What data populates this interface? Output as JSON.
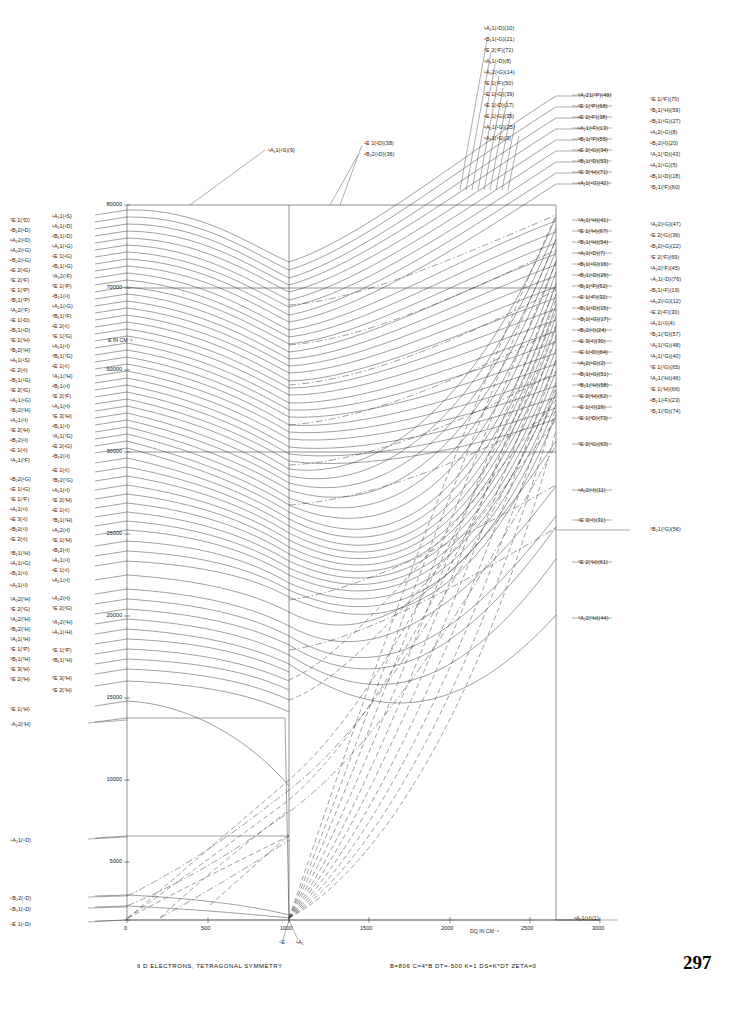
{
  "figure": {
    "caption": "6 D ELECTRONS, TETRAGONAL SYMMETRY",
    "parameters": "B=806  C=4*B  DT=-500  K=1  DS=K*DT  ZETA=0",
    "page_number": "297"
  },
  "axes": {
    "y_title": "E IN CM⁻¹",
    "x_title": "DQ IN CM⁻¹",
    "y_ticks": [
      "80000",
      "70000",
      "50000",
      "30000",
      "25000",
      "20000",
      "15000",
      "10000",
      "5000",
      "0"
    ],
    "x_ticks": [
      "0",
      "500",
      "1000",
      "1500",
      "2000",
      "2500",
      "3000"
    ],
    "x_range": [
      0,
      3000
    ],
    "y_range": [
      0,
      85000
    ],
    "ground_left": "⁵E",
    "ground_mid_left": "⁵E",
    "ground_mid_right": "¹A₁",
    "ground_right": "¹A₁1(¹I)(1)"
  },
  "chart_data": {
    "type": "line",
    "title": "6 D ELECTRONS, TETRAGONAL SYMMETRY",
    "xlabel": "DQ IN CM⁻¹",
    "ylabel": "E IN CM⁻¹",
    "xlim": [
      0,
      3000
    ],
    "ylim": [
      0,
      85000
    ],
    "grid": false,
    "legend": "none",
    "note": "Tanabe-Sugano style correlation diagram: energy levels of a d6 ion in tetragonal symmetry as a function of Dq. Level labels give term symbol, parent free-ion term in parentheses and state index."
  },
  "labels_left": [
    {
      "t": "³E  1(³D)",
      "y": 218
    },
    {
      "t": "¹B₂2(¹D)",
      "y": 228
    },
    {
      "t": "¹A₂2(¹D)",
      "y": 238
    },
    {
      "t": "¹A₂2(¹G)",
      "y": 248
    },
    {
      "t": "¹B₂2(¹G)",
      "y": 258
    },
    {
      "t": "¹E  2(¹G)",
      "y": 268
    },
    {
      "t": "³E  2(³F)",
      "y": 278
    },
    {
      "t": "³E  1(³P)",
      "y": 288
    },
    {
      "t": "³B₁1(³P)",
      "y": 298
    },
    {
      "t": "³A₂2(³F)",
      "y": 308
    },
    {
      "t": "¹E  1(¹D)",
      "y": 318
    },
    {
      "t": "¹B₁1(¹D)",
      "y": 328
    },
    {
      "t": "³E  1(³H)",
      "y": 338
    },
    {
      "t": "³B₁2(³H)",
      "y": 348
    },
    {
      "t": "¹A₁1(¹S)",
      "y": 358
    },
    {
      "t": "¹E  2(¹I)",
      "y": 368
    },
    {
      "t": "¹B₁1(¹G)",
      "y": 378
    },
    {
      "t": "³E  2(³G)",
      "y": 388
    },
    {
      "t": "¹A₂1(¹G)",
      "y": 398
    },
    {
      "t": "³B₂2(³H)",
      "y": 408
    },
    {
      "t": "¹A₂1(¹I)",
      "y": 418
    },
    {
      "t": "³E  2(³H)",
      "y": 428
    },
    {
      "t": "¹B₂2(¹I)",
      "y": 438
    },
    {
      "t": "¹E  1(¹I)",
      "y": 448
    },
    {
      "t": "³A₂1(³F)",
      "y": 458
    },
    {
      "t": "¹B₂2(¹G)",
      "y": 477
    },
    {
      "t": "¹E  1(¹G)",
      "y": 487
    },
    {
      "t": "³E  1(³F)",
      "y": 497
    },
    {
      "t": "¹A₁1(¹I)",
      "y": 507
    },
    {
      "t": "¹E  3(¹I)",
      "y": 517
    },
    {
      "t": "¹B₁2(¹I)",
      "y": 527
    },
    {
      "t": "¹E  2(¹I)",
      "y": 537
    },
    {
      "t": "³B₁1(³H)",
      "y": 551
    },
    {
      "t": "¹A₁1(¹G)",
      "y": 561
    },
    {
      "t": "¹B₁1(¹I)",
      "y": 571
    },
    {
      "t": "¹A₁1(¹I)",
      "y": 583
    },
    {
      "t": "³A₂2(³H)",
      "y": 597
    },
    {
      "t": "³E  2(³G)",
      "y": 607
    },
    {
      "t": "³A₂2(³H)",
      "y": 617
    },
    {
      "t": "³B₂2(³H)",
      "y": 627
    },
    {
      "t": "³A₁1(³H)",
      "y": 637
    },
    {
      "t": "³E  1(³P)",
      "y": 647
    },
    {
      "t": "³B₁1(³H)",
      "y": 657
    },
    {
      "t": "³E  3(³H)",
      "y": 667
    },
    {
      "t": "³E  2(³H)",
      "y": 677
    },
    {
      "t": "³E  1(³H)",
      "y": 707
    },
    {
      "t": "⁷A₂2(³H)",
      "y": 722
    },
    {
      "t": "⁵A₁1(⁵D)",
      "y": 838
    },
    {
      "t": "⁵B₂2(⁵D)",
      "y": 896
    },
    {
      "t": "⁵B₁1(⁵D)",
      "y": 907
    },
    {
      "t": "⁵E  1(⁵D)",
      "y": 922
    }
  ],
  "labels_left_inner": [
    {
      "t": "¹A₁1(¹S)",
      "y": 214
    },
    {
      "t": "¹A₁1(¹D)",
      "y": 224
    },
    {
      "t": "¹B₁1(¹D)",
      "y": 234
    },
    {
      "t": "¹A₁1(¹G)",
      "y": 244
    },
    {
      "t": "¹E  1(¹G)",
      "y": 254
    },
    {
      "t": "¹B₁1(¹G)",
      "y": 264
    },
    {
      "t": "³A₂2(³F)",
      "y": 274
    },
    {
      "t": "³E  1(³P)",
      "y": 284
    },
    {
      "t": "¹B₂1(¹I)",
      "y": 294
    },
    {
      "t": "¹A₂1(¹G)",
      "y": 304
    },
    {
      "t": "³B₁1(³F)",
      "y": 314
    },
    {
      "t": "¹E  2(¹I)",
      "y": 324
    },
    {
      "t": "³E  1(³G)",
      "y": 334
    },
    {
      "t": "¹A₁1(¹I)",
      "y": 344
    },
    {
      "t": "³B₁1(³G)",
      "y": 354
    },
    {
      "t": "¹E  1(¹I)",
      "y": 364
    },
    {
      "t": "³A₂1(³H)",
      "y": 374
    },
    {
      "t": "¹B₂1(¹I)",
      "y": 384
    },
    {
      "t": "³E  2(³F)",
      "y": 394
    },
    {
      "t": "¹A₂1(¹I)",
      "y": 404
    },
    {
      "t": "³E  3(³H)",
      "y": 414
    },
    {
      "t": "¹B₁1(¹I)",
      "y": 424
    },
    {
      "t": "³A₁1(³G)",
      "y": 434
    },
    {
      "t": "¹E  2(¹G)",
      "y": 444
    },
    {
      "t": "¹B₂2(¹I)",
      "y": 454
    },
    {
      "t": "¹E  1(¹I)",
      "y": 468
    },
    {
      "t": "³B₂2(³G)",
      "y": 478
    },
    {
      "t": "¹A₁1(¹I)",
      "y": 488
    },
    {
      "t": "³E  2(³H)",
      "y": 498
    },
    {
      "t": "¹E  1(¹I)",
      "y": 508
    },
    {
      "t": "³B₁1(³H)",
      "y": 518
    },
    {
      "t": "¹A₂2(¹I)",
      "y": 528
    },
    {
      "t": "³E  1(³H)",
      "y": 538
    },
    {
      "t": "¹B₁2(¹I)",
      "y": 548
    },
    {
      "t": "¹A₂1(¹I)",
      "y": 558
    },
    {
      "t": "¹E  1(¹I)",
      "y": 568
    },
    {
      "t": "¹A₂1(¹I)",
      "y": 578
    },
    {
      "t": "¹A₂2(¹I)",
      "y": 596
    },
    {
      "t": "³E  2(³G)",
      "y": 606
    },
    {
      "t": "³A₂2(³H)",
      "y": 620
    },
    {
      "t": "¹A₁1(¹H)",
      "y": 630
    },
    {
      "t": "³E  1(³P)",
      "y": 648
    },
    {
      "t": "³B₁1(³H)",
      "y": 658
    },
    {
      "t": "³E  3(³H)",
      "y": 676
    },
    {
      "t": "³E  2(³H)",
      "y": 688
    }
  ],
  "labels_top_center": [
    {
      "t": "¹A₁1(¹D)(10)",
      "y": 26
    },
    {
      "t": "¹B₁1(¹G)(21)",
      "y": 37
    },
    {
      "t": "³E  2(³F)(72)",
      "y": 48
    },
    {
      "t": "¹A₁1(¹D)(8)",
      "y": 59
    },
    {
      "t": "¹A₂2(¹G)(14)",
      "y": 70
    },
    {
      "t": "³E  1(³F)(50)",
      "y": 81
    },
    {
      "t": "¹E  1(¹G)(39)",
      "y": 92
    },
    {
      "t": "¹E  1(¹D)(17)",
      "y": 103
    },
    {
      "t": "¹E  1(¹G)(35)",
      "y": 114
    },
    {
      "t": "¹A₂1(¹G)(25)",
      "y": 125
    },
    {
      "t": "¹A₁1(¹S)(3)",
      "y": 136
    }
  ],
  "labels_annotations": [
    {
      "t": "¹A₁1(¹S)(9)",
      "x": 268,
      "y": 148
    },
    {
      "t": "¹E  1(¹D)(38)",
      "x": 364,
      "y": 141
    },
    {
      "t": "¹B₂2(¹D)(36)",
      "x": 364,
      "y": 152
    }
  ],
  "labels_right_col1": [
    {
      "t": "³A₂21(³P)(49)",
      "y": 93
    },
    {
      "t": "³E  1(³P)(68)",
      "y": 104
    },
    {
      "t": "¹E  2(¹F)(38)",
      "y": 115
    },
    {
      "t": "¹A₂1(¹F)(13)",
      "y": 126
    },
    {
      "t": "³B₁1(³F)(55)",
      "y": 137
    },
    {
      "t": "¹E  2(¹G)(34)",
      "y": 148
    },
    {
      "t": "³B₁1(³D)(53)",
      "y": 159
    },
    {
      "t": "³E  3(³H)(71)",
      "y": 170
    },
    {
      "t": "¹A₁1(¹G)(42)",
      "y": 181
    },
    {
      "t": "³A₁1(³H)(41)",
      "y": 218
    },
    {
      "t": "³E  1(³H)(67)",
      "y": 229
    },
    {
      "t": "³B₁1(³H)(54)",
      "y": 240
    },
    {
      "t": "¹A₁1(¹D)(7)",
      "y": 251
    },
    {
      "t": "¹B₁1(¹G)(16)",
      "y": 262
    },
    {
      "t": "¹B₂1(¹D)(26)",
      "y": 273
    },
    {
      "t": "³B₁1(³F)(52)",
      "y": 284
    },
    {
      "t": "¹E  1(¹F)(32)",
      "y": 295
    },
    {
      "t": "¹B₁1(¹D)(15)",
      "y": 306
    },
    {
      "t": "¹B₁1(¹G)(17)",
      "y": 317
    },
    {
      "t": "¹B₂2(¹I)(24)",
      "y": 328
    },
    {
      "t": "¹E  3(¹I)(30)",
      "y": 339
    },
    {
      "t": "¹E  1(¹D)(64)",
      "y": 350
    },
    {
      "t": "¹A₁2(¹G)(2)",
      "y": 361
    },
    {
      "t": "¹B₁1(¹G)(51)",
      "y": 372
    },
    {
      "t": "³B₂1(³H)(58)",
      "y": 383
    },
    {
      "t": "³E  2(³H)(62)",
      "y": 394
    },
    {
      "t": "¹E  1(¹I)(29)",
      "y": 405
    },
    {
      "t": "³E  1(³D)(73)",
      "y": 416
    },
    {
      "t": "³E  2(³G)(63)",
      "y": 442
    },
    {
      "t": "¹A₂2(¹I)(11)",
      "y": 488
    },
    {
      "t": "¹E  3(¹I)(31)",
      "y": 518
    },
    {
      "t": "³E  2(³H)(61)",
      "y": 560
    },
    {
      "t": "³A₂2(³H)(44)",
      "y": 616
    }
  ],
  "labels_right_col2": [
    {
      "t": "³E  1(³F)(70)",
      "y": 97
    },
    {
      "t": "³B₁1(³H)(59)",
      "y": 108
    },
    {
      "t": "¹B₁1(¹G)(27)",
      "y": 119
    },
    {
      "t": "¹A₁2(¹G)(8)",
      "y": 130
    },
    {
      "t": "¹B₂2(¹I)(20)",
      "y": 141
    },
    {
      "t": "³A₁1(³D)(43)",
      "y": 152
    },
    {
      "t": "¹A₁1(¹G)(5)",
      "y": 163
    },
    {
      "t": "¹B₁1(¹D)(18)",
      "y": 174
    },
    {
      "t": "³B₂1(³F)(60)",
      "y": 185
    },
    {
      "t": "³A₂2(¹G)(47)",
      "y": 222
    },
    {
      "t": "¹E  2(¹G)(36)",
      "y": 233
    },
    {
      "t": "¹B₂2(¹G)(22)",
      "y": 244
    },
    {
      "t": "³E  2(³F)(69)",
      "y": 255
    },
    {
      "t": "³A₂2(³F)(45)",
      "y": 266
    },
    {
      "t": "⁵A₁1(⁵D)(76)",
      "y": 277
    },
    {
      "t": "¹B₁1(¹F)(19)",
      "y": 288
    },
    {
      "t": "¹A₂2(¹G)(12)",
      "y": 299
    },
    {
      "t": "¹E  2(¹F)(30)",
      "y": 310
    },
    {
      "t": "¹A₁1(¹I)(4)",
      "y": 321
    },
    {
      "t": "³B₂1(³D)(57)",
      "y": 332
    },
    {
      "t": "³A₁1(³G)(48)",
      "y": 343
    },
    {
      "t": "³A₁1(³G)(40)",
      "y": 354
    },
    {
      "t": "³E  1(³G)(65)",
      "y": 365
    },
    {
      "t": "³A₂1(³H)(46)",
      "y": 376
    },
    {
      "t": "³E  1(³H)(66)",
      "y": 387
    },
    {
      "t": "¹B₂1(¹F)(23)",
      "y": 398
    },
    {
      "t": "³B₂1(³D)(74)",
      "y": 409
    },
    {
      "t": "³B₂1(³G)(56)",
      "y": 527
    }
  ]
}
